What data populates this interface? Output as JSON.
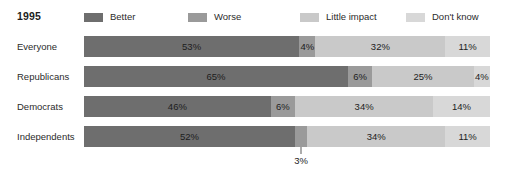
{
  "header": {
    "year": "1995"
  },
  "legend": {
    "items": [
      {
        "label": "Better",
        "color": "#6e6e6e",
        "x": 0
      },
      {
        "label": "Worse",
        "color": "#9a9a9a",
        "x": 104
      },
      {
        "label": "Little impact",
        "color": "#c9c9c9",
        "x": 216
      },
      {
        "label": "Don't know",
        "color": "#d8d8d8",
        "x": 322
      }
    ]
  },
  "chart_data": {
    "type": "bar",
    "subtype": "stacked-horizontal-100",
    "title": "1995",
    "xlabel": "",
    "ylabel": "",
    "xlim": [
      0,
      100
    ],
    "grid": false,
    "legend_position": "top",
    "categories": [
      "Everyone",
      "Republicans",
      "Democrats",
      "Independents"
    ],
    "series": [
      {
        "name": "Better",
        "color": "#6e6e6e",
        "values": [
          53,
          65,
          46,
          52
        ]
      },
      {
        "name": "Worse",
        "color": "#9a9a9a",
        "values": [
          4,
          6,
          6,
          3
        ]
      },
      {
        "name": "Little impact",
        "color": "#c9c9c9",
        "values": [
          32,
          25,
          34,
          34
        ]
      },
      {
        "name": "Don't know",
        "color": "#d8d8d8",
        "values": [
          11,
          4,
          14,
          11
        ]
      }
    ],
    "annotations": [
      {
        "category": "Independents",
        "series": "Worse",
        "text": "3%",
        "placement": "below-with-leader"
      }
    ]
  },
  "rows": [
    {
      "label": "Everyone",
      "top": 36,
      "segments": [
        {
          "name": "Better",
          "value": "53%",
          "pct": 53,
          "color": "#6e6e6e",
          "outside": false
        },
        {
          "name": "Worse",
          "value": "4%",
          "pct": 4,
          "color": "#9a9a9a",
          "outside": false
        },
        {
          "name": "Little impact",
          "value": "32%",
          "pct": 32,
          "color": "#c9c9c9",
          "outside": false
        },
        {
          "name": "Don't know",
          "value": "11%",
          "pct": 11,
          "color": "#d8d8d8",
          "outside": false
        }
      ]
    },
    {
      "label": "Republicans",
      "top": 66,
      "segments": [
        {
          "name": "Better",
          "value": "65%",
          "pct": 65,
          "color": "#6e6e6e",
          "outside": false
        },
        {
          "name": "Worse",
          "value": "6%",
          "pct": 6,
          "color": "#9a9a9a",
          "outside": false
        },
        {
          "name": "Little impact",
          "value": "25%",
          "pct": 25,
          "color": "#c9c9c9",
          "outside": false
        },
        {
          "name": "Don't know",
          "value": "4%",
          "pct": 4,
          "color": "#d8d8d8",
          "outside": false
        }
      ]
    },
    {
      "label": "Democrats",
      "top": 96,
      "segments": [
        {
          "name": "Better",
          "value": "46%",
          "pct": 46,
          "color": "#6e6e6e",
          "outside": false
        },
        {
          "name": "Worse",
          "value": "6%",
          "pct": 6,
          "color": "#9a9a9a",
          "outside": false
        },
        {
          "name": "Little impact",
          "value": "34%",
          "pct": 34,
          "color": "#c9c9c9",
          "outside": false
        },
        {
          "name": "Don't know",
          "value": "14%",
          "pct": 14,
          "color": "#d8d8d8",
          "outside": false
        }
      ]
    },
    {
      "label": "Independents",
      "top": 126,
      "segments": [
        {
          "name": "Better",
          "value": "52%",
          "pct": 52,
          "color": "#6e6e6e",
          "outside": false
        },
        {
          "name": "Worse",
          "value": "3%",
          "pct": 3,
          "color": "#9a9a9a",
          "outside": true
        },
        {
          "name": "Little impact",
          "value": "34%",
          "pct": 34,
          "color": "#c9c9c9",
          "outside": false
        },
        {
          "name": "Don't know",
          "value": "11%",
          "pct": 11,
          "color": "#d8d8d8",
          "outside": false
        }
      ]
    }
  ]
}
